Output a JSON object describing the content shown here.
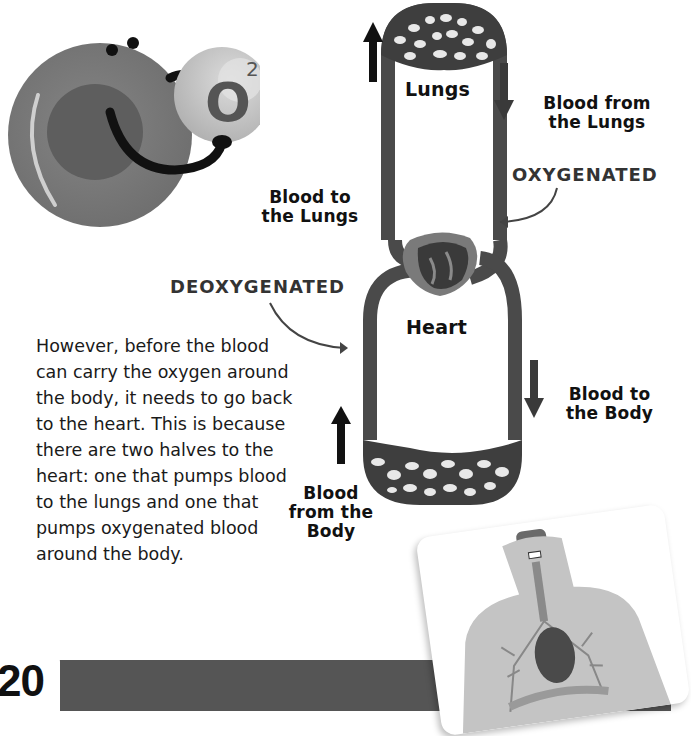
{
  "illustration": {
    "molecule_label": "O",
    "molecule_superscript": "2"
  },
  "diagram": {
    "lungs_label": "Lungs",
    "heart_label": "Heart",
    "arrows": {
      "blood_to_lungs": "Blood to the Lungs",
      "blood_from_lungs": "Blood from the Lungs",
      "blood_to_body": "Blood to the Body",
      "blood_from_body": "Blood from the Body"
    },
    "labels": {
      "blood_to_lungs_line1": "Blood to",
      "blood_to_lungs_line2": "the Lungs",
      "blood_from_lungs_line1": "Blood from",
      "blood_from_lungs_line2": "the Lungs",
      "blood_to_body_line1": "Blood to",
      "blood_to_body_line2": "the Body",
      "blood_from_body_line1": "Blood",
      "blood_from_body_line2": "from the",
      "blood_from_body_line3": "Body"
    },
    "states": {
      "oxygenated": "OXYGENATED",
      "deoxygenated": "DEOXYGENATED"
    }
  },
  "text": {
    "paragraph": "However, before the blood can carry the oxygen around the body, it needs to go back to the heart. This is because there are two halves to the heart: one that pumps blood to the lungs and one that pumps oxygenated blood around the body."
  },
  "footer": {
    "page_number": "20"
  },
  "colors": {
    "vessel": "#4a4a4a",
    "cell_outer": "#7a7a7a",
    "cell_inner": "#6a6a6a",
    "molecule": "#bdbdbd",
    "footer_bar": "#555555"
  }
}
